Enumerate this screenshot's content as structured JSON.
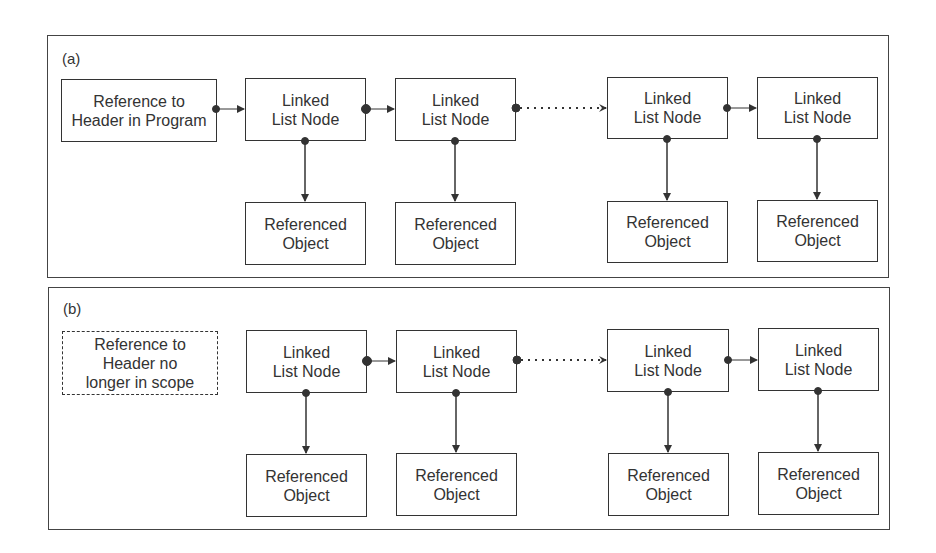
{
  "panels": [
    {
      "label": "(a)",
      "header": "Reference to Header in Program",
      "nodes": [
        "Linked List Node",
        "Linked List Node",
        "Linked List Node",
        "Linked List Node"
      ],
      "objects": [
        "Referenced Object",
        "Referenced Object",
        "Referenced Object",
        "Referenced Object"
      ]
    },
    {
      "label": "(b)",
      "header": "Reference to Header no longer in scope",
      "nodes": [
        "Linked List Node",
        "Linked List Node",
        "Linked List Node",
        "Linked List Node"
      ],
      "objects": [
        "Referenced Object",
        "Referenced Object",
        "Referenced Object",
        "Referenced Object"
      ]
    }
  ],
  "colors": {
    "line": "#333333",
    "background": "#ffffff"
  }
}
